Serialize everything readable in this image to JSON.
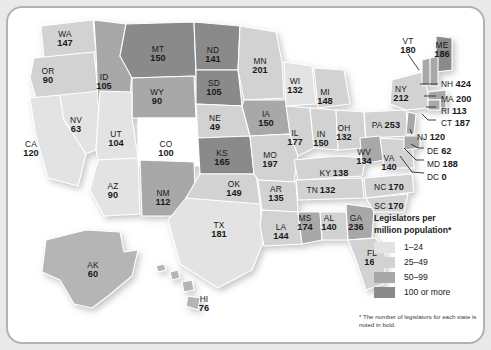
{
  "map": {
    "title": "Legislators per million population by state",
    "footnote": "* The number of legislators for each state is noted in bold.",
    "legend": {
      "title_line1": "Legislators per",
      "title_line2": "million population*",
      "items": [
        {
          "label": "1–24",
          "color": "#e3e3e3"
        },
        {
          "label": "25–49",
          "color": "#d2d2d2"
        },
        {
          "label": "50–99",
          "color": "#a8a8a8"
        },
        {
          "label": "100 or more",
          "color": "#8a8a8a"
        }
      ]
    },
    "states": [
      {
        "code": "WA",
        "value": "147",
        "shade": "#d2d2d2",
        "x": 57,
        "y": 31
      },
      {
        "code": "OR",
        "value": "90",
        "shade": "#d2d2d2",
        "x": 40,
        "y": 68
      },
      {
        "code": "CA",
        "value": "120",
        "shade": "#e3e3e3",
        "x": 23,
        "y": 141
      },
      {
        "code": "NV",
        "value": "63",
        "shade": "#e3e3e3",
        "x": 68,
        "y": 117
      },
      {
        "code": "ID",
        "value": "105",
        "shade": "#a8a8a8",
        "x": 96,
        "y": 74
      },
      {
        "code": "MT",
        "value": "150",
        "shade": "#8a8a8a",
        "x": 150,
        "y": 46
      },
      {
        "code": "WY",
        "value": "90",
        "shade": "#a8a8a8",
        "x": 149,
        "y": 89
      },
      {
        "code": "UT",
        "value": "104",
        "shade": "#e3e3e3",
        "x": 108,
        "y": 131
      },
      {
        "code": "CO",
        "value": "100",
        "shade": "#ffffff",
        "x": 158,
        "y": 141
      },
      {
        "code": "AZ",
        "value": "90",
        "shade": "#e3e3e3",
        "x": 105,
        "y": 183
      },
      {
        "code": "NM",
        "value": "112",
        "shade": "#a8a8a8",
        "x": 155,
        "y": 190
      },
      {
        "code": "ND",
        "value": "141",
        "shade": "#8a8a8a",
        "x": 205,
        "y": 47
      },
      {
        "code": "SD",
        "value": "105",
        "shade": "#8a8a8a",
        "x": 206,
        "y": 80
      },
      {
        "code": "NE",
        "value": "49",
        "shade": "#d2d2d2",
        "x": 207,
        "y": 115
      },
      {
        "code": "KS",
        "value": "165",
        "shade": "#8a8a8a",
        "x": 214,
        "y": 150
      },
      {
        "code": "OK",
        "value": "149",
        "shade": "#d2d2d2",
        "x": 226,
        "y": 181
      },
      {
        "code": "TX",
        "value": "181",
        "shade": "#e3e3e3",
        "x": 211,
        "y": 222
      },
      {
        "code": "MN",
        "value": "201",
        "shade": "#d2d2d2",
        "x": 252,
        "y": 58
      },
      {
        "code": "IA",
        "value": "150",
        "shade": "#a8a8a8",
        "x": 258,
        "y": 111
      },
      {
        "code": "MO",
        "value": "197",
        "shade": "#d2d2d2",
        "x": 262,
        "y": 152
      },
      {
        "code": "AR",
        "value": "135",
        "shade": "#d2d2d2",
        "x": 268,
        "y": 186
      },
      {
        "code": "LA",
        "value": "144",
        "shade": "#d2d2d2",
        "x": 273,
        "y": 224
      },
      {
        "code": "WI",
        "value": "132",
        "shade": "#e3e3e3",
        "x": 287,
        "y": 78
      },
      {
        "code": "IL",
        "value": "177",
        "shade": "#d2d2d2",
        "x": 287,
        "y": 130
      },
      {
        "code": "MS",
        "value": "174",
        "shade": "#a8a8a8",
        "x": 297,
        "y": 215
      },
      {
        "code": "MI",
        "value": "148",
        "shade": "#d2d2d2",
        "x": 317,
        "y": 89
      },
      {
        "code": "IN",
        "value": "150",
        "shade": "#d2d2d2",
        "x": 313,
        "y": 131
      },
      {
        "code": "AL",
        "value": "140",
        "shade": "#d2d2d2",
        "x": 321,
        "y": 215
      },
      {
        "code": "OH",
        "value": "132",
        "shade": "#d2d2d2",
        "x": 336,
        "y": 125
      },
      {
        "code": "GA",
        "value": "236",
        "shade": "#a8a8a8",
        "x": 348,
        "y": 215
      },
      {
        "code": "FL",
        "value": "160",
        "shade": "#d2d2d2",
        "x": 364,
        "y": 250
      },
      {
        "code": "AK",
        "value": "60",
        "shade": "#b5b5b5",
        "x": 85,
        "y": 262
      },
      {
        "code": "HI",
        "value": "76",
        "shade": "#b5b5b5",
        "x": 196,
        "y": 296
      },
      {
        "code": "VT",
        "value": "180",
        "shade": "#a8a8a8",
        "x": 400,
        "y": 38
      },
      {
        "code": "ME",
        "value": "186",
        "shade": "#8a8a8a",
        "x": 434,
        "y": 42
      },
      {
        "code": "NY",
        "value": "212",
        "shade": "#d2d2d2",
        "x": 393,
        "y": 86
      },
      {
        "code": "WV",
        "value": "134",
        "shade": "#a8a8a8",
        "x": 356,
        "y": 149
      },
      {
        "code": "VA",
        "value": "140",
        "shade": "#d2d2d2",
        "x": 381,
        "y": 155
      }
    ],
    "inline_states": [
      {
        "code": "KY",
        "value": "138",
        "x": 326,
        "y": 163
      },
      {
        "code": "TN",
        "value": "132",
        "x": 313,
        "y": 180
      },
      {
        "code": "PA",
        "value": "253",
        "x": 378,
        "y": 115
      },
      {
        "code": "NC",
        "value": "170",
        "x": 381,
        "y": 177
      },
      {
        "code": "SC",
        "value": "170",
        "x": 381,
        "y": 196
      }
    ],
    "callouts": [
      {
        "code": "NH",
        "value": "424",
        "x": 433,
        "y": 74
      },
      {
        "code": "MA",
        "value": "200",
        "x": 433,
        "y": 89
      },
      {
        "code": "RI",
        "value": "113",
        "x": 433,
        "y": 101
      },
      {
        "code": "CT",
        "value": "187",
        "x": 433,
        "y": 113
      },
      {
        "code": "NJ",
        "value": "120",
        "x": 409,
        "y": 127
      },
      {
        "code": "DE",
        "value": "62",
        "x": 419,
        "y": 141
      },
      {
        "code": "MD",
        "value": "188",
        "x": 419,
        "y": 154
      },
      {
        "code": "DC",
        "value": "0",
        "x": 419,
        "y": 167
      }
    ]
  },
  "chart_data": {
    "type": "map",
    "title": "Legislators per million population",
    "footnote": "* The number of legislators for each state is noted in bold.",
    "unit": "legislators per million population",
    "legend_bins": [
      "1–24",
      "25–49",
      "50–99",
      "100 or more"
    ],
    "categories": [
      "WA",
      "OR",
      "CA",
      "NV",
      "ID",
      "MT",
      "WY",
      "UT",
      "CO",
      "AZ",
      "NM",
      "ND",
      "SD",
      "NE",
      "KS",
      "OK",
      "TX",
      "MN",
      "IA",
      "MO",
      "AR",
      "LA",
      "WI",
      "IL",
      "MS",
      "MI",
      "IN",
      "AL",
      "OH",
      "GA",
      "FL",
      "AK",
      "HI",
      "VT",
      "ME",
      "NY",
      "WV",
      "VA",
      "KY",
      "TN",
      "PA",
      "NC",
      "SC",
      "NH",
      "MA",
      "RI",
      "CT",
      "NJ",
      "DE",
      "MD",
      "DC"
    ],
    "values": [
      147,
      90,
      120,
      63,
      105,
      150,
      90,
      104,
      100,
      90,
      112,
      141,
      105,
      49,
      165,
      149,
      181,
      201,
      150,
      197,
      135,
      144,
      132,
      177,
      174,
      148,
      150,
      140,
      132,
      236,
      160,
      60,
      76,
      180,
      186,
      212,
      134,
      140,
      138,
      132,
      253,
      170,
      170,
      424,
      200,
      113,
      187,
      120,
      62,
      188,
      0
    ]
  }
}
